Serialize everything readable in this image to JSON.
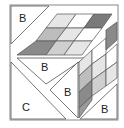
{
  "diagram": {
    "type": "cube-tangram-puzzle",
    "labels": {
      "top_left_triangle": "B",
      "middle_triangle": "B",
      "bottom_left_triangle": "C",
      "right_small_triangle": "B",
      "bottom_right_triangle": "B"
    },
    "colors": {
      "stroke": "#555555",
      "white": "#ffffff",
      "light": "#e6e6e6",
      "lighter": "#d8d8d8",
      "mid": "#b8b8b8",
      "dark": "#8a8a8a",
      "darker": "#6e6e6e"
    }
  }
}
